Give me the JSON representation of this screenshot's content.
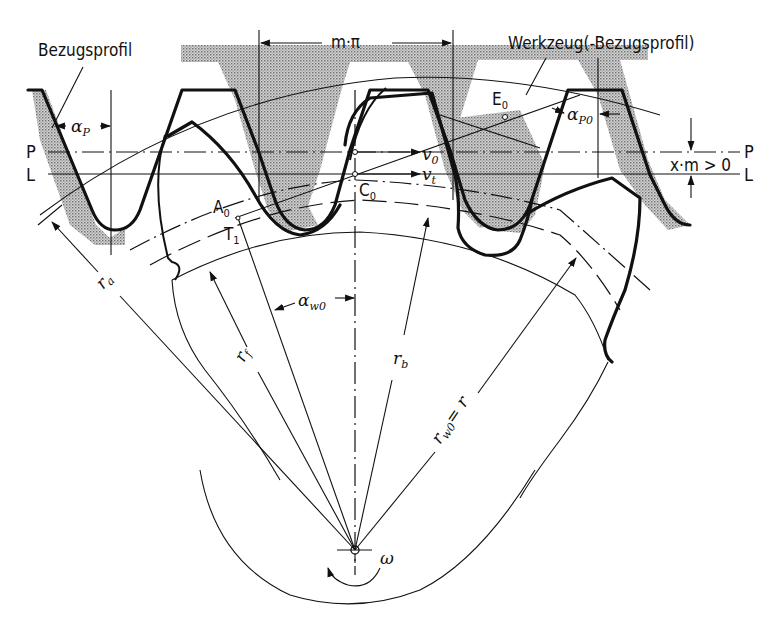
{
  "diagram": {
    "type": "gear generation by rack-type cutting tool (profile shift)",
    "labels": {
      "reference_profile": "Bezugsprofil",
      "tool_profile": "Werkzeug(-Bezugsprofil)",
      "pitch": "m·π",
      "line_P": "P",
      "line_L": "L",
      "line_P_right": "P",
      "line_L_right": "L",
      "profile_shift": "x·m > 0",
      "alpha_P": "α",
      "alpha_P_sub": "P",
      "alpha_P0": "α",
      "alpha_P0_sub": "P0",
      "alpha_w0": "α",
      "alpha_w0_sub": "w0",
      "E0": "E",
      "E0_sub": "0",
      "C0": "C",
      "C0_sub": "0",
      "A0": "A",
      "A0_sub": "0",
      "T1": "T",
      "T1_sub": "1",
      "v0": "v",
      "v0_sub": "0",
      "vt": "v",
      "vt_sub": "t",
      "ra": "r",
      "ra_sub": "a",
      "rf": "r",
      "rf_sub": "f",
      "rb": "r",
      "rb_sub": "b",
      "rw0": "r",
      "rw0_sub": "w0",
      "rw0_eq": "= r",
      "omega": "ω"
    },
    "colors": {
      "ink": "#111111",
      "shading": "#9a9a9a",
      "background": "#ffffff"
    }
  }
}
